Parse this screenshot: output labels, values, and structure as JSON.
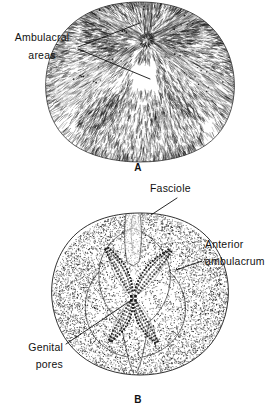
{
  "figure": {
    "type": "scientific-illustration",
    "background_color": "#ffffff",
    "ink_color": "#111111",
    "width": 280,
    "height": 416
  },
  "panels": [
    {
      "id": "A",
      "letter": "A",
      "description": "spine-covered specimen, aboral view",
      "letter_x": 138,
      "letter_y": 171
    },
    {
      "id": "B",
      "letter": "B",
      "description": "denuded test showing petaloid ambulacra, aboral view",
      "letter_x": 138,
      "letter_y": 403
    }
  ],
  "labels": [
    {
      "id": "ambulacral-areas",
      "lines": [
        "Ambulacral",
        "areas"
      ],
      "text_anchor": "middle",
      "x": 42,
      "y1": 41,
      "y2": 59,
      "leaders": [
        {
          "points": "78,47 140,23"
        },
        {
          "points": "78,49 150,79"
        }
      ]
    },
    {
      "id": "fasciole",
      "lines": [
        "Fasciole"
      ],
      "text_anchor": "start",
      "x": 150,
      "y1": 192,
      "leaders": [
        {
          "points": "177,198 151,215"
        }
      ]
    },
    {
      "id": "anterior-ambulacrum",
      "lines": [
        "Anterior",
        "ambulacrum"
      ],
      "text_anchor": "start",
      "x": 205,
      "y1": 248,
      "y2": 265,
      "leaders": [
        {
          "points": "202,261 176,270"
        }
      ]
    },
    {
      "id": "genital-pores",
      "lines": [
        "Genital",
        "pores"
      ],
      "text_anchor": "end",
      "x": 63,
      "y1": 351,
      "y2": 368,
      "leaders": [
        {
          "points": "66,344 133,299"
        }
      ]
    }
  ]
}
